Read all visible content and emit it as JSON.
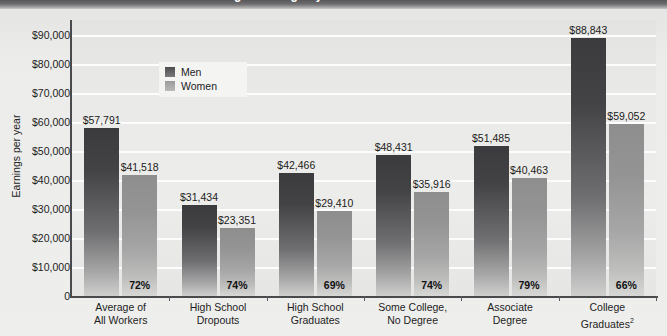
{
  "banner": {
    "text_clipped": "Average Earnings by Education Level"
  },
  "chart_data": {
    "type": "bar",
    "title": "",
    "xlabel": "",
    "ylabel": "Earnings per year",
    "ylim": [
      0,
      95000
    ],
    "grid": true,
    "legend_position": "inside-top-left",
    "categories": [
      "Average of\nAll Workers",
      "High School\nDropouts",
      "High School\nGraduates",
      "Some College,\nNo Degree",
      "Associate\nDegree",
      "College\nGraduates"
    ],
    "series": [
      {
        "name": "Men",
        "values": [
          57791,
          31434,
          42466,
          48431,
          51485,
          88843
        ]
      },
      {
        "name": "Women",
        "values": [
          41518,
          23351,
          29410,
          35916,
          40463,
          59052
        ]
      }
    ],
    "annotations": {
      "women_pct_of_men": [
        "72%",
        "74%",
        "69%",
        "74%",
        "79%",
        "66%"
      ]
    },
    "ytick_labels": [
      "$90,000",
      "$80,000",
      "$70,000",
      "$60,000",
      "$50,000",
      "$40,000",
      "$30,000",
      "$20,000",
      "$10,000",
      "0"
    ],
    "ytick_values": [
      90000,
      80000,
      70000,
      60000,
      50000,
      40000,
      30000,
      20000,
      10000,
      0
    ]
  },
  "legend": {
    "items": [
      {
        "label": "Men",
        "color": "#4d4d4f"
      },
      {
        "label": "Women",
        "color": "#9b9b9c"
      }
    ]
  },
  "groups": [
    {
      "line1": "Average of",
      "line2": "All Workers",
      "men_value": "$57,791",
      "women_value": "$41,518",
      "pct": "72%"
    },
    {
      "line1": "High School",
      "line2": "Dropouts",
      "men_value": "$31,434",
      "women_value": "$23,351",
      "pct": "74%"
    },
    {
      "line1": "High School",
      "line2": "Graduates",
      "men_value": "$42,466",
      "women_value": "$29,410",
      "pct": "69%"
    },
    {
      "line1": "Some College,",
      "line2": "No Degree",
      "men_value": "$48,431",
      "women_value": "$35,916",
      "pct": "74%"
    },
    {
      "line1": "Associate",
      "line2": "Degree",
      "men_value": "$51,485",
      "women_value": "$40,463",
      "pct": "79%"
    },
    {
      "line1": "College",
      "line2": "Graduates",
      "line2_sup": "2",
      "men_value": "$88,843",
      "women_value": "$59,052",
      "pct": "66%"
    }
  ],
  "axis": {
    "y_title": "Earnings per year"
  },
  "colors": {
    "men_bar_top": "#3b3b3d",
    "women_bar_top": "#8e8e8f",
    "plot_background": "#eaeae8",
    "gridline": "#fdfdfd",
    "axis": "#4a4a4c",
    "page_background": "#e9e9e7"
  }
}
